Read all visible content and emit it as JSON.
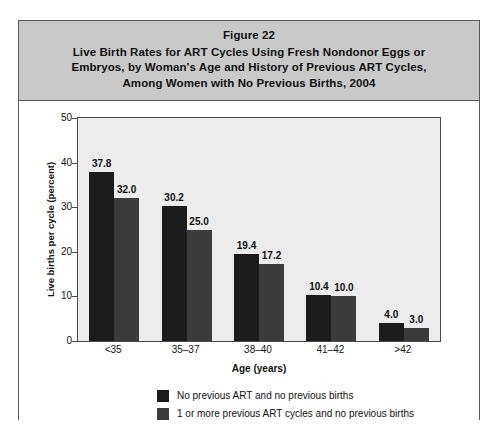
{
  "figure": {
    "title_lines": [
      "Figure 22",
      "Live Birth Rates for ART Cycles Using Fresh Nondonor Eggs or",
      "Embryos, by Woman's Age and History of Previous ART Cycles,",
      "Among Women with No Previous Births, 2004"
    ]
  },
  "colors": {
    "series_1": "#1c1c1c",
    "series_2": "#3b3b3b",
    "title_band": "#c9c9c9",
    "plot_background": "#ececec",
    "frame": "#4a4a4a"
  },
  "chart_data": {
    "type": "bar",
    "title": "Live Birth Rates for ART Cycles Using Fresh Nondonor Eggs or Embryos, by Woman's Age and History of Previous ART Cycles, Among Women with No Previous Births, 2004",
    "xlabel": "Age (years)",
    "ylabel": "Live births per cycle (percent)",
    "categories": [
      "<35",
      "35–37",
      "38–40",
      "41–42",
      ">42"
    ],
    "series": [
      {
        "name": "No previous ART and no previous births",
        "values": [
          37.8,
          30.2,
          19.4,
          10.4,
          4.0
        ],
        "labels": [
          "37.8",
          "30.2",
          "19.4",
          "10.4",
          "4.0"
        ]
      },
      {
        "name": "1 or more previous ART cycles and no previous births",
        "values": [
          32.0,
          25.0,
          17.2,
          10.0,
          3.0
        ],
        "labels": [
          "32.0",
          "25.0",
          "17.2",
          "10.0",
          "3.0"
        ]
      }
    ],
    "ylim": [
      0,
      50
    ],
    "yticks": [
      0,
      10,
      20,
      30,
      40,
      50
    ],
    "ytick_labels": [
      "0",
      "10",
      "20",
      "30",
      "40",
      "50"
    ],
    "grid": false,
    "legend_position": "below"
  }
}
